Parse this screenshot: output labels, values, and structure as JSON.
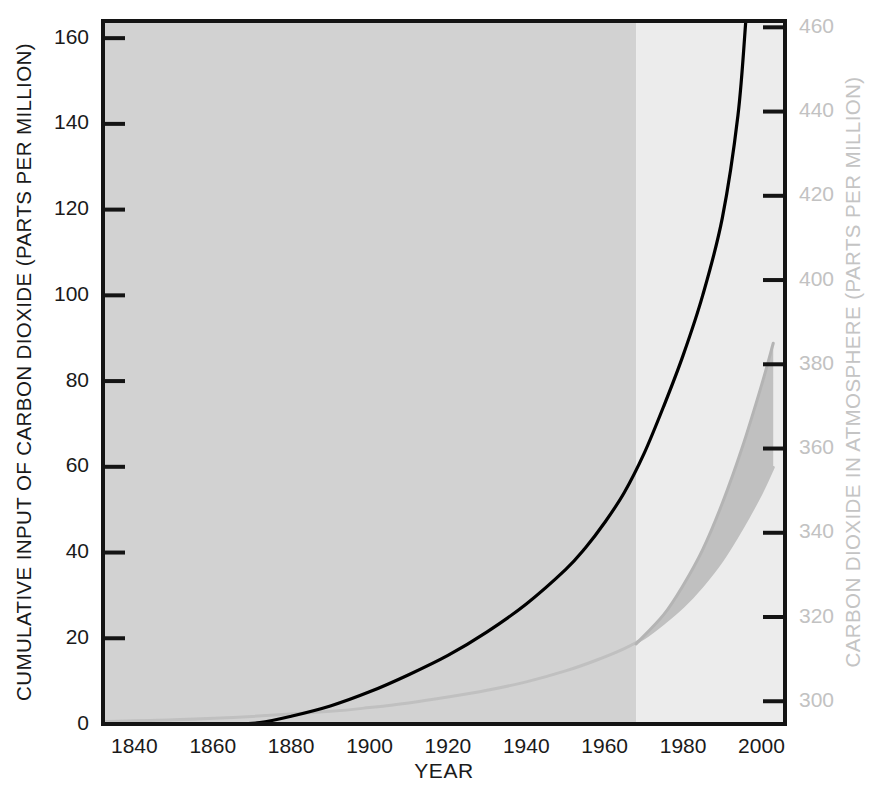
{
  "chart_data": {
    "type": "line",
    "title": "",
    "xlabel": "YEAR",
    "ylabel": "CUMULATIVE INPUT OF CARBON DIOXIDE (PARTS PER MILLION)",
    "y2label": "CARBON DIOXIDE IN ATMOSPHERE (PARTS PER MILLION)",
    "xlim": [
      1832,
      2006
    ],
    "ylim": [
      0,
      164
    ],
    "y2lim": [
      294.6,
      461.5
    ],
    "grid": false,
    "legend": null,
    "x_ticks": [
      1840,
      1860,
      1880,
      1900,
      1920,
      1940,
      1960,
      1980,
      2000
    ],
    "y_ticks": [
      0,
      20,
      40,
      60,
      80,
      100,
      120,
      140,
      160
    ],
    "y2_ticks": [
      300,
      320,
      340,
      360,
      380,
      400,
      420,
      440,
      460
    ],
    "x_tick_labels": [
      "1840",
      "1860",
      "1880",
      "1900",
      "1920",
      "1940",
      "1960",
      "1980",
      "2000"
    ],
    "y_tick_labels": [
      "0",
      "20",
      "40",
      "60",
      "80",
      "100",
      "120",
      "140",
      "160"
    ],
    "y2_tick_labels": [
      "300",
      "320",
      "340",
      "360",
      "380",
      "400",
      "420",
      "440",
      "460"
    ],
    "shaded_regions": [
      {
        "name": "historical-record-region",
        "x_start": 1832,
        "x_end": 1968,
        "color": "#d2d2d2",
        "label": ""
      },
      {
        "name": "projection-region",
        "x_start": 1968,
        "x_end": 2006,
        "color": "#ececec",
        "label": ""
      }
    ],
    "series": [
      {
        "name": "Cumulative input of carbon dioxide",
        "axis": "left",
        "color": "#000000",
        "style": "solid",
        "linewidth": 3.2,
        "x": [
          1832,
          1845,
          1855,
          1865,
          1872,
          1880,
          1890,
          1900,
          1910,
          1920,
          1930,
          1940,
          1950,
          1955,
          1960,
          1965,
          1970,
          1975,
          1980,
          1985,
          1990,
          1994,
          1996
        ],
        "y": [
          0,
          0,
          0,
          0,
          0.3,
          1.8,
          4.2,
          7.5,
          11.5,
          16.0,
          21.5,
          28.0,
          36.0,
          41.0,
          47.0,
          54.0,
          63.0,
          74.0,
          86.0,
          100.0,
          118.0,
          142.0,
          164.0
        ]
      },
      {
        "name": "Carbon dioxide in atmosphere (lower bound)",
        "axis": "right",
        "color": "#c0c0c0",
        "style": "solid",
        "linewidth": 3.0,
        "x": [
          1832,
          1850,
          1870,
          1890,
          1900,
          1910,
          1920,
          1930,
          1940,
          1950,
          1958,
          1965,
          1970,
          1975,
          1980,
          1985,
          1990,
          1995,
          2000,
          2003
        ],
        "y": [
          295.2,
          295.6,
          296.4,
          297.6,
          298.5,
          299.6,
          301.0,
          302.6,
          304.6,
          307.2,
          309.8,
          312.5,
          315.0,
          318.5,
          322.5,
          327.5,
          333.5,
          341.0,
          349.5,
          355.5
        ]
      },
      {
        "name": "Carbon dioxide in atmosphere (upper bound)",
        "axis": "right",
        "color": "#b4b4b4",
        "style": "solid",
        "linewidth": 3.0,
        "x": [
          1968,
          1975,
          1980,
          1985,
          1990,
          1995,
          2000,
          2003
        ],
        "y": [
          313.6,
          320.5,
          327.5,
          336.0,
          347.0,
          360.0,
          375.0,
          385.0
        ]
      }
    ],
    "band": {
      "name": "uncertainty-band",
      "axis": "right",
      "color": "#b9b9b9",
      "opacity": 0.85,
      "x_start": 1968,
      "x_end": 2003,
      "lower_at_end": 378,
      "upper_at_end": 400,
      "description": "Wedge-shaped uncertainty band widening from 1968 to 2003"
    }
  },
  "axes": {
    "left": {
      "title": "CUMULATIVE INPUT OF CARBON DIOXIDE (PARTS PER MILLION)"
    },
    "right": {
      "title": "CARBON DIOXIDE IN ATMOSPHERE (PARTS PER MILLION)"
    },
    "bottom": {
      "title": "YEAR"
    }
  }
}
